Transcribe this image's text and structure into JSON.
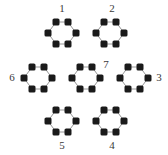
{
  "figure": {
    "kind": "honeycomb-lattice-diagram",
    "width": 168,
    "height": 155,
    "background_color": "#ffffff",
    "dot_color": "#1a1a1a",
    "dot_shape": "rounded-square",
    "dot_size": 7,
    "edge_color": "#8a8a8a",
    "label_color": "#3a3a3a"
  },
  "hexagons": [
    {
      "id": "hex-1",
      "label": "1",
      "cx": 62,
      "cy": 33,
      "label_x": 62,
      "label_y": 9
    },
    {
      "id": "hex-2",
      "label": "2",
      "cx": 110,
      "cy": 33,
      "label_x": 112,
      "label_y": 9
    },
    {
      "id": "hex-3",
      "label": "3",
      "cx": 134,
      "cy": 78,
      "label_x": 159,
      "label_y": 78
    },
    {
      "id": "hex-4",
      "label": "4",
      "cx": 110,
      "cy": 121,
      "label_x": 112,
      "label_y": 146
    },
    {
      "id": "hex-5",
      "label": "5",
      "cx": 62,
      "cy": 121,
      "label_x": 62,
      "label_y": 146
    },
    {
      "id": "hex-6",
      "label": "6",
      "cx": 38,
      "cy": 78,
      "label_x": 12,
      "label_y": 78
    },
    {
      "id": "hex-7",
      "label": "7",
      "cx": 86,
      "cy": 78,
      "label_x": 106,
      "label_y": 65
    }
  ],
  "vertices": [
    {
      "x": 56,
      "y": 22
    },
    {
      "x": 69,
      "y": 22
    },
    {
      "x": 48,
      "y": 33
    },
    {
      "x": 62,
      "y": 33
    },
    {
      "x": 76,
      "y": 33
    },
    {
      "x": 56,
      "y": 44
    },
    {
      "x": 69,
      "y": 44
    },
    {
      "x": 104,
      "y": 22
    },
    {
      "x": 117,
      "y": 22
    },
    {
      "x": 96,
      "y": 33
    },
    {
      "x": 110,
      "y": 33
    },
    {
      "x": 124,
      "y": 33
    },
    {
      "x": 104,
      "y": 44
    },
    {
      "x": 117,
      "y": 44
    },
    {
      "x": 32,
      "y": 66
    },
    {
      "x": 45,
      "y": 66
    },
    {
      "x": 24,
      "y": 78
    },
    {
      "x": 38,
      "y": 78
    },
    {
      "x": 52,
      "y": 78
    },
    {
      "x": 32,
      "y": 89
    },
    {
      "x": 45,
      "y": 89
    },
    {
      "x": 80,
      "y": 66
    },
    {
      "x": 93,
      "y": 66
    },
    {
      "x": 72,
      "y": 78
    },
    {
      "x": 86,
      "y": 78
    },
    {
      "x": 100,
      "y": 78
    },
    {
      "x": 80,
      "y": 89
    },
    {
      "x": 93,
      "y": 89
    },
    {
      "x": 128,
      "y": 66
    },
    {
      "x": 141,
      "y": 66
    },
    {
      "x": 120,
      "y": 78
    },
    {
      "x": 134,
      "y": 78
    },
    {
      "x": 148,
      "y": 78
    },
    {
      "x": 128,
      "y": 89
    },
    {
      "x": 141,
      "y": 89
    },
    {
      "x": 56,
      "y": 110
    },
    {
      "x": 69,
      "y": 110
    },
    {
      "x": 48,
      "y": 121
    },
    {
      "x": 62,
      "y": 121
    },
    {
      "x": 76,
      "y": 121
    },
    {
      "x": 56,
      "y": 132
    },
    {
      "x": 69,
      "y": 132
    },
    {
      "x": 104,
      "y": 110
    },
    {
      "x": 117,
      "y": 110
    },
    {
      "x": 96,
      "y": 121
    },
    {
      "x": 110,
      "y": 121
    },
    {
      "x": 124,
      "y": 121
    },
    {
      "x": 104,
      "y": 132
    },
    {
      "x": 117,
      "y": 132
    }
  ]
}
